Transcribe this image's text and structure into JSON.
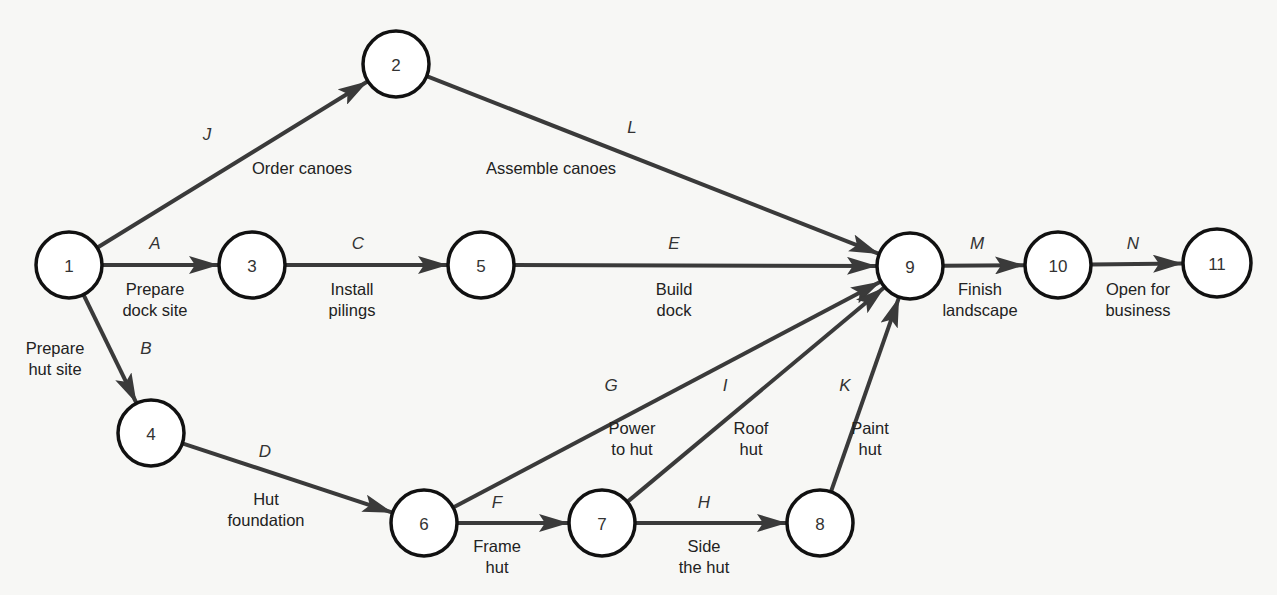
{
  "diagram": {
    "type": "activity-on-arrow network",
    "colors": {
      "background": "#f7f7f5",
      "node_stroke": "#111111",
      "edge": "#3a3a3a",
      "text": "#222222"
    },
    "nodes": [
      {
        "id": "1",
        "x": 69,
        "y": 265,
        "r": 33
      },
      {
        "id": "2",
        "x": 396,
        "y": 64,
        "r": 33
      },
      {
        "id": "3",
        "x": 252,
        "y": 265,
        "r": 33
      },
      {
        "id": "4",
        "x": 151,
        "y": 433,
        "r": 33
      },
      {
        "id": "5",
        "x": 481,
        "y": 265,
        "r": 33
      },
      {
        "id": "6",
        "x": 424,
        "y": 523,
        "r": 33
      },
      {
        "id": "7",
        "x": 602,
        "y": 523,
        "r": 33
      },
      {
        "id": "8",
        "x": 820,
        "y": 523,
        "r": 33
      },
      {
        "id": "9",
        "x": 910,
        "y": 266,
        "r": 33
      },
      {
        "id": "10",
        "x": 1058,
        "y": 265,
        "r": 33
      },
      {
        "id": "11",
        "x": 1217,
        "y": 263,
        "r": 34
      }
    ],
    "edges": [
      {
        "letter": "J",
        "from": "1",
        "to": "2",
        "desc": [
          "Order canoes"
        ],
        "letter_pos": [
          207,
          140
        ],
        "desc_pos": [
          302,
          174
        ]
      },
      {
        "letter": "A",
        "from": "1",
        "to": "3",
        "desc": [
          "Prepare",
          "dock site"
        ],
        "letter_pos": [
          155,
          249
        ],
        "desc_pos": [
          155,
          295
        ]
      },
      {
        "letter": "B",
        "from": "1",
        "to": "4",
        "desc": [
          "Prepare",
          "hut site"
        ],
        "letter_pos": [
          146,
          354
        ],
        "desc_pos": [
          55,
          354
        ]
      },
      {
        "letter": "C",
        "from": "3",
        "to": "5",
        "desc": [
          "Install",
          "pilings"
        ],
        "letter_pos": [
          358,
          249
        ],
        "desc_pos": [
          352,
          295
        ]
      },
      {
        "letter": "L",
        "from": "2",
        "to": "9",
        "desc": [
          "Assemble canoes"
        ],
        "letter_pos": [
          632,
          133
        ],
        "desc_pos": [
          551,
          174
        ]
      },
      {
        "letter": "E",
        "from": "5",
        "to": "9",
        "desc": [
          "Build",
          "dock"
        ],
        "letter_pos": [
          674,
          249
        ],
        "desc_pos": [
          674,
          295
        ]
      },
      {
        "letter": "D",
        "from": "4",
        "to": "6",
        "desc": [
          "Hut",
          "foundation"
        ],
        "letter_pos": [
          265,
          457
        ],
        "desc_pos": [
          266,
          505
        ]
      },
      {
        "letter": "G",
        "from": "6",
        "to": "9",
        "desc": [
          "Power",
          "to hut"
        ],
        "letter_pos": [
          611,
          391
        ],
        "desc_pos": [
          632,
          434
        ]
      },
      {
        "letter": "F",
        "from": "6",
        "to": "7",
        "desc": [
          "Frame",
          "hut"
        ],
        "letter_pos": [
          497,
          508
        ],
        "desc_pos": [
          497,
          552
        ]
      },
      {
        "letter": "I",
        "from": "7",
        "to": "9",
        "desc": [
          "Roof",
          "hut"
        ],
        "letter_pos": [
          725,
          391
        ],
        "desc_pos": [
          751,
          434
        ]
      },
      {
        "letter": "H",
        "from": "7",
        "to": "8",
        "desc": [
          "Side",
          "the hut"
        ],
        "letter_pos": [
          704,
          508
        ],
        "desc_pos": [
          704,
          552
        ]
      },
      {
        "letter": "K",
        "from": "8",
        "to": "9",
        "desc": [
          "Paint",
          "hut"
        ],
        "letter_pos": [
          845,
          391
        ],
        "desc_pos": [
          870,
          434
        ]
      },
      {
        "letter": "M",
        "from": "9",
        "to": "10",
        "desc": [
          "Finish",
          "landscape"
        ],
        "letter_pos": [
          977,
          249
        ],
        "desc_pos": [
          980,
          295
        ]
      },
      {
        "letter": "N",
        "from": "10",
        "to": "11",
        "desc": [
          "Open for",
          "business"
        ],
        "letter_pos": [
          1133,
          249
        ],
        "desc_pos": [
          1138,
          295
        ]
      }
    ]
  }
}
